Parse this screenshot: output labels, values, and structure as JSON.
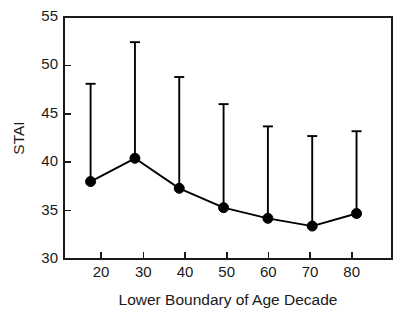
{
  "chart_data": {
    "type": "line",
    "title": "",
    "subtitle": "",
    "xlabel": "Lower Boundary of Age Decade",
    "ylabel": "STAI",
    "x": [
      20,
      30,
      40,
      50,
      60,
      70,
      80
    ],
    "xtick_labels": [
      "20",
      "30",
      "40",
      "50",
      "60",
      "70",
      "80"
    ],
    "ytick_labels": [
      "30",
      "35",
      "40",
      "45",
      "50",
      "55"
    ],
    "yticks": [
      30,
      35,
      40,
      45,
      50,
      55
    ],
    "xlim": [
      14,
      88
    ],
    "ylim": [
      30,
      55
    ],
    "grid": false,
    "legend": null,
    "series": [
      {
        "name": "STAI mean",
        "marker": "filled-circle",
        "values": [
          38.0,
          40.4,
          37.3,
          35.3,
          34.2,
          33.4,
          34.7
        ],
        "error_upper": [
          48.1,
          52.4,
          48.8,
          46.0,
          43.7,
          42.7,
          43.2
        ],
        "error_bar_style": "upper-only-with-cap"
      }
    ],
    "annotations": []
  },
  "figure": {
    "axis_color": "#1a1a1a",
    "series_color": "#000000",
    "background": "#ffffff"
  }
}
